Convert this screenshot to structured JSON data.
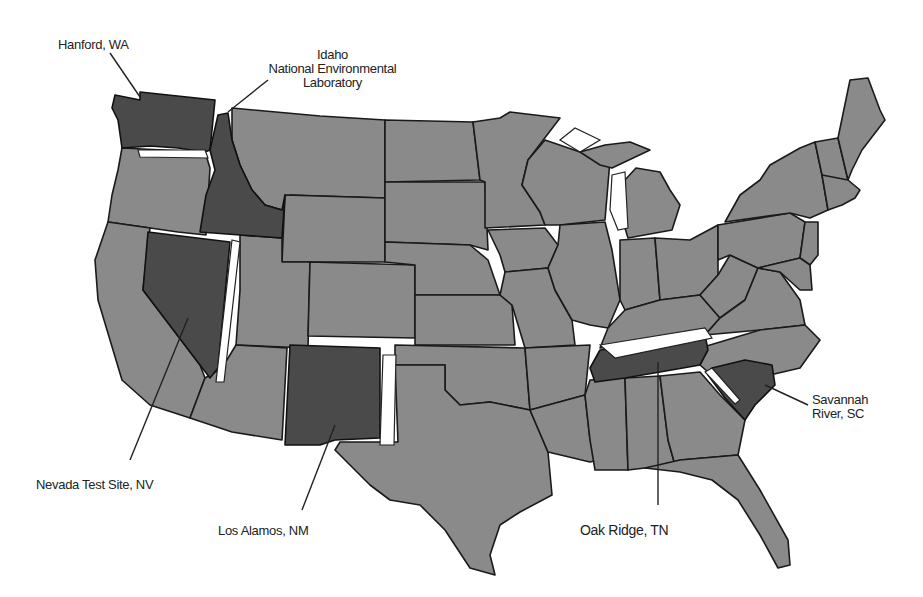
{
  "map": {
    "subject": "Contiguous United States",
    "colors": {
      "state_fill": "#8a8a8a",
      "site_state_fill": "#4a4a4a",
      "border": "#1a1a1a",
      "background": "#ffffff"
    },
    "highlighted_states": [
      "WA",
      "ID",
      "NV",
      "NM",
      "TN",
      "SC"
    ]
  },
  "labels": {
    "hanford": "Hanford, WA",
    "idaho_line1": "Idaho",
    "idaho_line2": "National Environmental",
    "idaho_line3": "Laboratory",
    "nevada": "Nevada Test Site, NV",
    "los_alamos": "Los Alamos, NM",
    "oak_ridge": "Oak Ridge, TN",
    "savannah_line1": "Savannah",
    "savannah_line2": "River, SC"
  }
}
